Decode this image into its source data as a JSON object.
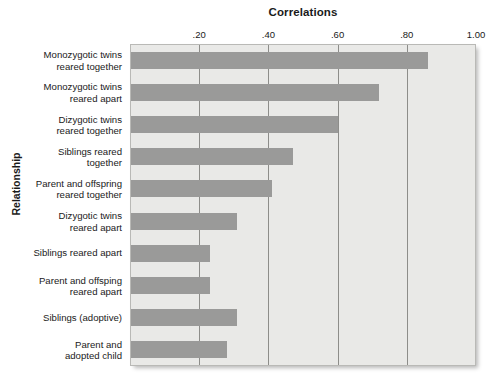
{
  "chart_data": {
    "type": "bar",
    "orientation": "horizontal",
    "title": "Correlations",
    "xlabel": "Correlations",
    "ylabel": "Relationship",
    "xlim": [
      0.0,
      1.0
    ],
    "xticks": [
      0.2,
      0.4,
      0.6,
      0.8,
      1.0
    ],
    "xtick_labels": [
      ".20",
      ".40",
      ".60",
      ".80",
      "1.00"
    ],
    "grid": "vertical",
    "legend": "none",
    "bar_color": "#9a9a99",
    "plot_background": "#e9e9e7",
    "categories": [
      "Monozygotic twins reared together",
      "Monozygotic twins reared apart",
      "Dizygotic twins reared together",
      "Siblings reared together",
      "Parent and offspring reared together",
      "Dizygotic twins reared apart",
      "Siblings reared apart",
      "Parent and offsping reared apart",
      "Siblings (adoptive)",
      "Parent and adopted child"
    ],
    "category_lines": [
      [
        "Monozygotic twins",
        "reared together"
      ],
      [
        "Monozygotic twins",
        "reared apart"
      ],
      [
        "Dizygotic twins",
        "reared together"
      ],
      [
        "Siblings reared",
        "together"
      ],
      [
        "Parent and offspring",
        "reared together"
      ],
      [
        "Dizygotic twins",
        "reared apart"
      ],
      [
        "Siblings reared apart"
      ],
      [
        "Parent and offsping",
        "reared apart"
      ],
      [
        "Siblings (adoptive)"
      ],
      [
        "Parent and",
        "adopted child"
      ]
    ],
    "values": [
      0.86,
      0.72,
      0.6,
      0.47,
      0.41,
      0.31,
      0.23,
      0.23,
      0.31,
      0.28
    ]
  }
}
